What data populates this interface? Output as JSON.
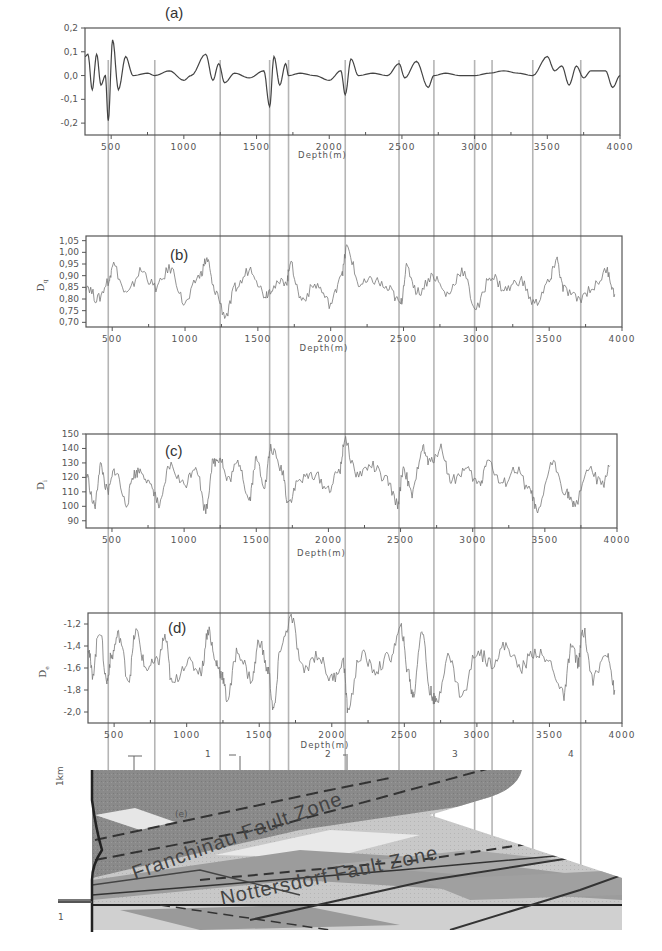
{
  "figure": {
    "x_axis": {
      "label": "Depth(m)",
      "ticks": [
        "500",
        "1000",
        "1500",
        "2000",
        "2500",
        "3000",
        "3500",
        "4000"
      ],
      "range": [
        320,
        4000
      ]
    },
    "guide_lines_depth_m": [
      480,
      800,
      1250,
      1590,
      1720,
      2110,
      2480,
      2720,
      3000,
      3120,
      3400,
      3730
    ],
    "panels": [
      {
        "id": "a",
        "label": "(a)",
        "ylabel": "",
        "yticks": [
          "0,2",
          "0,1",
          "0,0",
          "-0,1",
          "-0,2"
        ]
      },
      {
        "id": "b",
        "label": "(b)",
        "ylabel": "D",
        "ylabel_sub": "q",
        "yticks": [
          "1,05",
          "1,00",
          "0,95",
          "0,90",
          "0,85",
          "0,80",
          "0,75",
          "0,70"
        ]
      },
      {
        "id": "c",
        "label": "(c)",
        "ylabel": "D",
        "ylabel_sub": "i",
        "yticks": [
          "150",
          "140",
          "130",
          "120",
          "110",
          "100",
          "90"
        ]
      },
      {
        "id": "d",
        "label": "(d)",
        "ylabel": "D",
        "ylabel_sub": "e",
        "yticks": [
          "-1,2",
          "-1,4",
          "-1,6",
          "-1,8",
          "-2,0"
        ]
      },
      {
        "id": "e",
        "label": "(e)",
        "section_markers": [
          "1",
          "2",
          "3",
          "4"
        ],
        "fault_zones": [
          "Franchinau Fault Zone",
          "Nottersdorf Fault Zone"
        ],
        "left_marks": [
          "1 km",
          "1"
        ]
      }
    ]
  },
  "chart_data": [
    {
      "type": "line",
      "title": "(a)",
      "xlabel": "Depth(m)",
      "ylabel": "",
      "xlim": [
        320,
        4000
      ],
      "ylim": [
        -0.25,
        0.2
      ],
      "grid": false,
      "x": [
        320,
        340,
        370,
        400,
        430,
        460,
        480,
        510,
        550,
        600,
        650,
        750,
        800,
        900,
        1000,
        1050,
        1150,
        1200,
        1240,
        1280,
        1350,
        1450,
        1550,
        1590,
        1620,
        1660,
        1700,
        1720,
        1800,
        1900,
        2000,
        2080,
        2110,
        2150,
        2200,
        2300,
        2400,
        2480,
        2520,
        2600,
        2680,
        2720,
        2800,
        2900,
        3000,
        3100,
        3200,
        3300,
        3400,
        3500,
        3550,
        3600,
        3650,
        3700,
        3750,
        3800,
        3900,
        3950,
        4000
      ],
      "values": [
        0.08,
        0.09,
        -0.06,
        0.09,
        -0.04,
        0.0,
        -0.19,
        0.15,
        -0.06,
        0.08,
        0.0,
        0.01,
        0.0,
        0.02,
        -0.02,
        0.0,
        0.09,
        -0.02,
        0.05,
        -0.03,
        0.01,
        -0.01,
        0.02,
        -0.13,
        0.08,
        -0.04,
        0.05,
        0.0,
        0.01,
        0.0,
        -0.02,
        0.02,
        -0.08,
        0.07,
        0.0,
        0.01,
        0.0,
        0.05,
        -0.01,
        0.06,
        -0.05,
        0.0,
        0.01,
        0.0,
        0.0,
        0.01,
        0.02,
        0.01,
        0.0,
        0.08,
        0.02,
        0.04,
        -0.04,
        0.04,
        -0.01,
        0.02,
        0.02,
        -0.05,
        0.0
      ]
    },
    {
      "type": "line",
      "title": "(b)",
      "xlabel": "Depth(m)",
      "ylabel": "Dq",
      "xlim": [
        320,
        4000
      ],
      "ylim": [
        0.68,
        1.07
      ],
      "grid": false,
      "x": [
        320,
        400,
        480,
        500,
        600,
        700,
        800,
        900,
        1000,
        1100,
        1150,
        1200,
        1280,
        1350,
        1450,
        1550,
        1600,
        1700,
        1720,
        1800,
        1900,
        2000,
        2080,
        2110,
        2200,
        2300,
        2400,
        2480,
        2520,
        2600,
        2700,
        2800,
        2900,
        3000,
        3100,
        3200,
        3300,
        3400,
        3500,
        3550,
        3600,
        3700,
        3800,
        3900,
        3950
      ],
      "values": [
        0.86,
        0.8,
        0.88,
        0.95,
        0.82,
        0.92,
        0.85,
        0.93,
        0.78,
        0.9,
        0.97,
        0.84,
        0.73,
        0.85,
        0.93,
        0.82,
        0.85,
        0.88,
        0.95,
        0.8,
        0.86,
        0.78,
        0.92,
        1.02,
        0.86,
        0.88,
        0.84,
        0.78,
        0.93,
        0.83,
        0.9,
        0.82,
        0.92,
        0.76,
        0.9,
        0.84,
        0.88,
        0.78,
        0.87,
        0.97,
        0.84,
        0.8,
        0.85,
        0.92,
        0.82
      ]
    },
    {
      "type": "line",
      "title": "(c)",
      "xlabel": "Depth(m)",
      "ylabel": "Di",
      "xlim": [
        320,
        4000
      ],
      "ylim": [
        85,
        150
      ],
      "grid": false,
      "x": [
        320,
        380,
        420,
        470,
        520,
        600,
        650,
        700,
        780,
        830,
        900,
        1000,
        1080,
        1150,
        1200,
        1250,
        1300,
        1380,
        1450,
        1500,
        1560,
        1600,
        1680,
        1720,
        1800,
        1900,
        2000,
        2080,
        2110,
        2200,
        2300,
        2400,
        2480,
        2520,
        2580,
        2650,
        2700,
        2780,
        2850,
        2950,
        3050,
        3100,
        3200,
        3300,
        3400,
        3450,
        3550,
        3650,
        3700,
        3800,
        3900,
        3950
      ],
      "values": [
        122,
        100,
        128,
        110,
        125,
        102,
        122,
        125,
        112,
        100,
        128,
        115,
        128,
        98,
        130,
        134,
        118,
        130,
        105,
        132,
        115,
        140,
        125,
        103,
        118,
        122,
        112,
        125,
        145,
        122,
        128,
        118,
        102,
        126,
        108,
        140,
        130,
        140,
        118,
        125,
        115,
        132,
        115,
        125,
        110,
        95,
        130,
        110,
        100,
        125,
        115,
        128
      ]
    },
    {
      "type": "line",
      "title": "(d)",
      "xlabel": "Depth(m)",
      "ylabel": "De",
      "xlim": [
        320,
        4000
      ],
      "ylim": [
        -2.1,
        -1.1
      ],
      "grid": false,
      "x": [
        320,
        350,
        400,
        450,
        480,
        530,
        600,
        650,
        720,
        800,
        850,
        900,
        1000,
        1100,
        1150,
        1200,
        1240,
        1280,
        1350,
        1450,
        1500,
        1560,
        1600,
        1650,
        1720,
        1800,
        1900,
        2000,
        2080,
        2110,
        2200,
        2300,
        2400,
        2480,
        2520,
        2560,
        2620,
        2680,
        2720,
        2800,
        2900,
        3000,
        3100,
        3200,
        3300,
        3400,
        3500,
        3600,
        3650,
        3700,
        3730,
        3800,
        3900,
        3950
      ],
      "values": [
        -1.4,
        -1.65,
        -1.25,
        -1.72,
        -1.5,
        -1.3,
        -1.7,
        -1.27,
        -1.6,
        -1.55,
        -1.32,
        -1.75,
        -1.55,
        -1.62,
        -1.25,
        -1.55,
        -1.65,
        -1.88,
        -1.45,
        -1.7,
        -1.35,
        -1.62,
        -1.98,
        -1.4,
        -1.15,
        -1.62,
        -1.48,
        -1.7,
        -1.55,
        -1.97,
        -1.48,
        -1.62,
        -1.5,
        -1.25,
        -1.6,
        -1.85,
        -1.25,
        -1.82,
        -1.92,
        -1.5,
        -1.85,
        -1.45,
        -1.55,
        -1.4,
        -1.6,
        -1.45,
        -1.55,
        -1.85,
        -1.4,
        -1.55,
        -1.25,
        -1.7,
        -1.45,
        -1.8
      ]
    }
  ]
}
